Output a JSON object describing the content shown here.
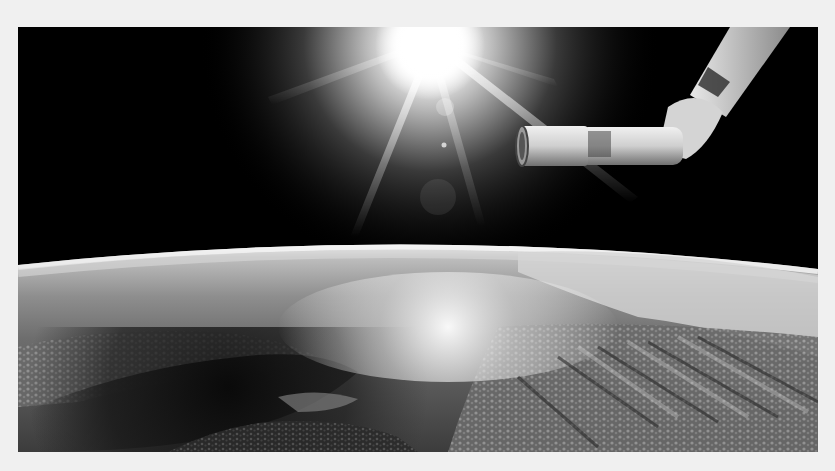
{
  "image": {
    "alt": "Earth seen from orbit with the sun flaring above the horizon and a robotic arm extending from the upper right",
    "tone": "grayscale",
    "colors": {
      "page_background": "#f0f0f0",
      "space": "#000000",
      "sun_core": "#ffffff",
      "atmosphere_glow": "#e8e8e8",
      "ocean_dark": "#141414",
      "cloud": "#bdbdbd",
      "arm_light": "#d9d9d9",
      "arm_shadow": "#5a5a5a"
    },
    "subjects": [
      "sun-with-lens-flare",
      "robotic-arm",
      "earth-horizon",
      "ocean-sun-glint",
      "cloud-fields"
    ]
  }
}
